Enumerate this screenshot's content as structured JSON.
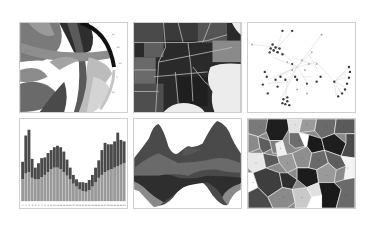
{
  "collage": {
    "layout": {
      "rows": 2,
      "columns": 3,
      "background": "#ffffff",
      "border": "#cfcfcf"
    },
    "palette": [
      "#1e1e1e",
      "#3a3a3a",
      "#555555",
      "#6e6e6e",
      "#8a8a8a",
      "#a8a8a8",
      "#c8c8c8",
      "#e6e6e6"
    ],
    "panels": [
      {
        "id": "chord",
        "kind": "chord-diagram",
        "x": 19,
        "y": 22,
        "w": 109,
        "h": 91
      },
      {
        "id": "map",
        "kind": "choropleth-map",
        "region": "Southeastern United States",
        "x": 133,
        "y": 22,
        "w": 109,
        "h": 91
      },
      {
        "id": "network",
        "kind": "force-directed-graph",
        "x": 247,
        "y": 22,
        "w": 109,
        "h": 91
      },
      {
        "id": "bars",
        "kind": "stacked-bar-chart",
        "x": 19,
        "y": 118,
        "w": 109,
        "h": 91
      },
      {
        "id": "stream",
        "kind": "streamgraph",
        "x": 133,
        "y": 118,
        "w": 109,
        "h": 91
      },
      {
        "id": "voronoi",
        "kind": "voronoi-diagram",
        "x": 247,
        "y": 118,
        "w": 109,
        "h": 91
      }
    ]
  },
  "chart_data": [
    {
      "type": "bar",
      "title": "",
      "stacked": true,
      "categories": [
        "1",
        "2",
        "3",
        "4",
        "5",
        "6",
        "7",
        "8",
        "9",
        "10",
        "11",
        "12",
        "13",
        "14",
        "15",
        "16",
        "17",
        "18",
        "19",
        "20",
        "21",
        "22",
        "23",
        "24",
        "25",
        "26",
        "27",
        "28",
        "29",
        "30",
        "31",
        "32",
        "33"
      ],
      "series": [
        {
          "name": "lower",
          "values": [
            30,
            38,
            40,
            32,
            30,
            30,
            33,
            36,
            40,
            44,
            46,
            46,
            44,
            40,
            35,
            30,
            24,
            20,
            16,
            14,
            13,
            15,
            20,
            26,
            32,
            36,
            40,
            42,
            44,
            46,
            48,
            50,
            52
          ]
        },
        {
          "name": "upper",
          "values": [
            24,
            52,
            58,
            26,
            16,
            22,
            26,
            24,
            26,
            26,
            28,
            30,
            30,
            28,
            22,
            16,
            12,
            10,
            10,
            12,
            12,
            14,
            16,
            20,
            24,
            34,
            40,
            36,
            34,
            36,
            46,
            34,
            30
          ]
        }
      ],
      "xlabel": "",
      "ylabel": "",
      "grid": false
    },
    {
      "type": "area",
      "title": "",
      "layout": "streamgraph",
      "x": [
        0,
        1,
        2,
        3,
        4,
        5,
        6,
        7,
        8,
        9,
        10
      ],
      "series": [
        {
          "name": "layer-1",
          "values": [
            10,
            28,
            34,
            14,
            8,
            10,
            12,
            18,
            30,
            32,
            16
          ]
        },
        {
          "name": "layer-2",
          "values": [
            12,
            16,
            18,
            10,
            10,
            14,
            16,
            14,
            18,
            16,
            12
          ]
        },
        {
          "name": "layer-3",
          "values": [
            10,
            12,
            12,
            10,
            8,
            10,
            12,
            12,
            14,
            12,
            10
          ]
        },
        {
          "name": "layer-4",
          "values": [
            6,
            8,
            8,
            6,
            4,
            6,
            6,
            8,
            8,
            8,
            6
          ]
        }
      ],
      "xlabel": "",
      "ylabel": "",
      "grid": false
    }
  ]
}
